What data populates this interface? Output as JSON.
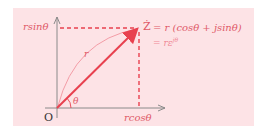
{
  "diagram": {
    "type": "phasor-diagram",
    "labels": {
      "origin": "O",
      "vertical_projection": "rsinθ",
      "horizontal_projection": "rcosθ",
      "magnitude": "r",
      "angle": "θ",
      "phasor_symbol": "Ż",
      "equation_line1": "= r (cosθ + jsinθ)",
      "equation_line2_prefix": "= rε",
      "equation_line2_exponent": "jθ"
    },
    "colors": {
      "panel_background": "#fde3e6",
      "accent_red": "#e8414f",
      "label_red": "#e05a68",
      "axis_gray": "#8a8a8a",
      "text_dark": "#333333"
    }
  }
}
